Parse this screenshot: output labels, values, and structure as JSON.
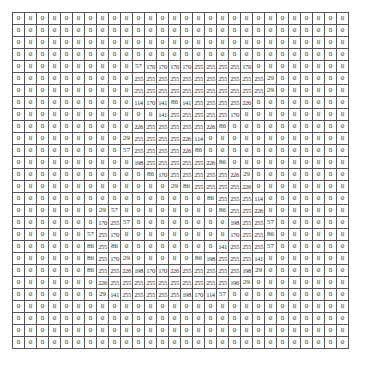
{
  "title": "",
  "grid": {
    "rows": 28,
    "cols": 28,
    "values": [
      [
        0,
        0,
        0,
        0,
        0,
        0,
        0,
        0,
        0,
        0,
        0,
        0,
        0,
        0,
        0,
        0,
        0,
        0,
        0,
        0,
        0,
        0,
        0,
        0,
        0,
        0,
        0,
        0
      ],
      [
        0,
        0,
        0,
        0,
        0,
        0,
        0,
        0,
        0,
        0,
        0,
        0,
        0,
        0,
        0,
        0,
        0,
        0,
        0,
        0,
        0,
        0,
        0,
        0,
        0,
        0,
        0,
        0
      ],
      [
        0,
        0,
        0,
        0,
        0,
        0,
        0,
        0,
        0,
        0,
        0,
        0,
        0,
        0,
        0,
        0,
        0,
        0,
        0,
        0,
        0,
        0,
        0,
        0,
        0,
        0,
        0,
        0
      ],
      [
        0,
        0,
        0,
        0,
        0,
        0,
        0,
        0,
        0,
        0,
        0,
        0,
        0,
        0,
        0,
        0,
        0,
        0,
        0,
        0,
        0,
        0,
        0,
        0,
        0,
        0,
        0,
        0
      ],
      [
        0,
        0,
        0,
        0,
        0,
        0,
        0,
        0,
        0,
        0,
        57,
        170,
        170,
        170,
        170,
        255,
        255,
        255,
        255,
        170,
        0,
        0,
        0,
        0,
        0,
        0,
        0,
        0
      ],
      [
        0,
        0,
        0,
        0,
        0,
        0,
        0,
        0,
        0,
        0,
        255,
        255,
        255,
        255,
        255,
        255,
        255,
        255,
        255,
        255,
        255,
        29,
        0,
        0,
        0,
        0,
        0,
        0
      ],
      [
        0,
        0,
        0,
        0,
        0,
        0,
        0,
        0,
        0,
        0,
        255,
        255,
        255,
        255,
        255,
        255,
        255,
        255,
        255,
        255,
        255,
        29,
        0,
        0,
        0,
        0,
        0,
        0
      ],
      [
        0,
        0,
        0,
        0,
        0,
        0,
        0,
        0,
        0,
        0,
        114,
        170,
        141,
        86,
        141,
        255,
        255,
        255,
        255,
        226,
        0,
        0,
        0,
        0,
        0,
        0,
        0,
        0
      ],
      [
        0,
        0,
        0,
        0,
        0,
        0,
        0,
        0,
        0,
        0,
        0,
        0,
        141,
        255,
        255,
        255,
        255,
        255,
        170,
        0,
        0,
        0,
        0,
        0,
        0,
        0,
        0,
        0
      ],
      [
        0,
        0,
        0,
        0,
        0,
        0,
        0,
        0,
        0,
        0,
        226,
        255,
        255,
        255,
        255,
        255,
        226,
        86,
        0,
        0,
        0,
        0,
        0,
        0,
        0,
        0,
        0,
        0
      ],
      [
        0,
        0,
        0,
        0,
        0,
        0,
        0,
        0,
        0,
        29,
        255,
        255,
        255,
        255,
        226,
        114,
        0,
        0,
        0,
        0,
        0,
        0,
        0,
        0,
        0,
        0,
        0,
        0
      ],
      [
        0,
        0,
        0,
        0,
        0,
        0,
        0,
        0,
        0,
        57,
        255,
        255,
        255,
        255,
        226,
        86,
        0,
        0,
        0,
        0,
        0,
        0,
        0,
        0,
        0,
        0,
        0,
        0
      ],
      [
        0,
        0,
        0,
        0,
        0,
        0,
        0,
        0,
        0,
        0,
        198,
        255,
        255,
        255,
        255,
        255,
        226,
        86,
        0,
        0,
        0,
        0,
        0,
        0,
        0,
        0,
        0,
        0
      ],
      [
        0,
        0,
        0,
        0,
        0,
        0,
        0,
        0,
        0,
        0,
        0,
        86,
        170,
        255,
        255,
        255,
        255,
        255,
        226,
        29,
        0,
        0,
        0,
        0,
        0,
        0,
        0,
        0
      ],
      [
        0,
        0,
        0,
        0,
        0,
        0,
        0,
        0,
        0,
        0,
        0,
        0,
        0,
        29,
        86,
        255,
        255,
        255,
        255,
        226,
        0,
        0,
        0,
        0,
        0,
        0,
        0,
        0
      ],
      [
        0,
        0,
        0,
        0,
        0,
        0,
        0,
        0,
        0,
        0,
        0,
        0,
        0,
        0,
        0,
        0,
        86,
        255,
        255,
        255,
        114,
        0,
        0,
        0,
        0,
        0,
        0,
        0
      ],
      [
        0,
        0,
        0,
        0,
        0,
        0,
        0,
        29,
        57,
        0,
        0,
        0,
        0,
        0,
        0,
        0,
        0,
        86,
        255,
        255,
        226,
        0,
        0,
        0,
        0,
        0,
        0,
        0
      ],
      [
        0,
        0,
        0,
        0,
        0,
        0,
        0,
        170,
        255,
        57,
        0,
        0,
        0,
        0,
        0,
        0,
        0,
        0,
        198,
        255,
        255,
        57,
        0,
        0,
        0,
        0,
        0,
        0
      ],
      [
        0,
        0,
        0,
        0,
        0,
        0,
        57,
        255,
        170,
        0,
        0,
        0,
        0,
        0,
        0,
        0,
        0,
        0,
        170,
        255,
        255,
        86,
        0,
        0,
        0,
        0,
        0,
        0
      ],
      [
        0,
        0,
        0,
        0,
        0,
        0,
        86,
        255,
        86,
        0,
        0,
        0,
        0,
        0,
        0,
        0,
        0,
        141,
        255,
        255,
        255,
        57,
        0,
        0,
        0,
        0,
        0,
        0
      ],
      [
        0,
        0,
        0,
        0,
        0,
        0,
        86,
        255,
        170,
        29,
        0,
        0,
        0,
        0,
        0,
        86,
        198,
        255,
        255,
        255,
        141,
        0,
        0,
        0,
        0,
        0,
        0,
        0
      ],
      [
        0,
        0,
        0,
        0,
        0,
        0,
        86,
        255,
        255,
        226,
        198,
        170,
        170,
        226,
        255,
        255,
        255,
        255,
        255,
        198,
        29,
        0,
        0,
        0,
        0,
        0,
        0,
        0
      ],
      [
        0,
        0,
        0,
        0,
        0,
        0,
        0,
        226,
        255,
        255,
        255,
        255,
        255,
        255,
        255,
        255,
        255,
        255,
        196,
        29,
        0,
        0,
        0,
        0,
        0,
        0,
        0,
        0
      ],
      [
        0,
        0,
        0,
        0,
        0,
        0,
        0,
        29,
        141,
        255,
        255,
        255,
        255,
        255,
        198,
        170,
        114,
        57,
        0,
        0,
        0,
        0,
        0,
        0,
        0,
        0,
        0,
        0
      ],
      [
        0,
        0,
        0,
        0,
        0,
        0,
        0,
        0,
        0,
        0,
        0,
        0,
        0,
        0,
        0,
        0,
        0,
        0,
        0,
        0,
        0,
        0,
        0,
        0,
        0,
        0,
        0,
        0
      ],
      [
        0,
        0,
        0,
        0,
        0,
        0,
        0,
        0,
        0,
        0,
        0,
        0,
        0,
        0,
        0,
        0,
        0,
        0,
        0,
        0,
        0,
        0,
        0,
        0,
        0,
        0,
        0,
        0
      ],
      [
        0,
        0,
        0,
        0,
        0,
        0,
        0,
        0,
        0,
        0,
        0,
        0,
        0,
        0,
        0,
        0,
        0,
        0,
        0,
        0,
        0,
        0,
        0,
        0,
        0,
        0,
        0,
        0
      ],
      [
        0,
        0,
        0,
        0,
        0,
        0,
        0,
        0,
        0,
        0,
        0,
        0,
        0,
        0,
        0,
        0,
        0,
        0,
        0,
        0,
        0,
        0,
        0,
        0,
        0,
        0,
        0,
        0
      ]
    ]
  },
  "colors": {
    "background": "#ffffff",
    "grid_line": "#555555",
    "text": "#333333"
  }
}
